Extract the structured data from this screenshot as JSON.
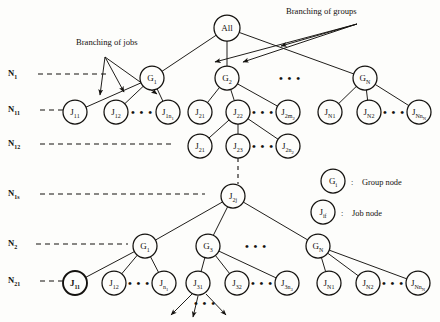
{
  "figure": {
    "background": "#fdfdfb",
    "ink": "#14120f",
    "annotations": [
      {
        "id": "branching-of-groups",
        "text": "Branching of groups",
        "x": 286,
        "y": 14
      },
      {
        "id": "branching-of-jobs",
        "text": "Branching of jobs",
        "x": 76,
        "y": 45
      }
    ],
    "level_labels": [
      {
        "id": "n1",
        "base": "N",
        "sub": "1",
        "x": 8,
        "y": 76,
        "dash_from": 38,
        "dash_to": 108,
        "dash_y": 74
      },
      {
        "id": "n11",
        "base": "N",
        "sub": "11",
        "x": 8,
        "y": 112,
        "dash_from": 40,
        "dash_to": 70,
        "dash_y": 110
      },
      {
        "id": "n12",
        "base": "N",
        "sub": "12",
        "x": 8,
        "y": 146,
        "dash_from": 40,
        "dash_to": 175,
        "dash_y": 144
      },
      {
        "id": "n1s",
        "base": "N",
        "sub": "1s",
        "x": 8,
        "y": 196,
        "dash_from": 40,
        "dash_to": 205,
        "dash_y": 194
      },
      {
        "id": "n2",
        "base": "N",
        "sub": "2",
        "x": 8,
        "y": 246,
        "dash_from": 36,
        "dash_to": 128,
        "dash_y": 244
      },
      {
        "id": "n21",
        "base": "N",
        "sub": "21",
        "x": 8,
        "y": 283,
        "dash_from": 40,
        "dash_to": 68,
        "dash_y": 281
      }
    ],
    "nodes": [
      {
        "id": "root-all",
        "label": "All",
        "sub": "",
        "sub2": "",
        "cx": 227,
        "cy": 28,
        "r": 13,
        "bold": false,
        "type": "root"
      },
      {
        "id": "g1-lvl1",
        "label": "G",
        "sub": "1",
        "sub2": "",
        "cx": 152,
        "cy": 78,
        "r": 12,
        "bold": false,
        "type": "group"
      },
      {
        "id": "g2-lvl1",
        "label": "G",
        "sub": "2",
        "sub2": "",
        "cx": 227,
        "cy": 78,
        "r": 12,
        "bold": false,
        "type": "group"
      },
      {
        "id": "gn-lvl1",
        "label": "G",
        "sub": "N",
        "sub2": "",
        "cx": 365,
        "cy": 78,
        "r": 12,
        "bold": false,
        "type": "group"
      },
      {
        "id": "j11",
        "label": "J",
        "sub": "11",
        "sub2": "",
        "cx": 75,
        "cy": 112,
        "r": 12,
        "bold": false,
        "type": "job"
      },
      {
        "id": "j12",
        "label": "J",
        "sub": "12",
        "sub2": "",
        "cx": 116,
        "cy": 112,
        "r": 12,
        "bold": false,
        "type": "job"
      },
      {
        "id": "j1n1",
        "label": "J",
        "sub": "1n",
        "sub2": "1",
        "cx": 168,
        "cy": 112,
        "r": 12,
        "bold": false,
        "type": "job"
      },
      {
        "id": "j21-a",
        "label": "J",
        "sub": "21",
        "sub2": "",
        "cx": 200,
        "cy": 112,
        "r": 12,
        "bold": false,
        "type": "job"
      },
      {
        "id": "j22",
        "label": "J",
        "sub": "22",
        "sub2": "",
        "cx": 238,
        "cy": 112,
        "r": 12,
        "bold": false,
        "type": "job"
      },
      {
        "id": "j2m2",
        "label": "J",
        "sub": "2m",
        "sub2": "2",
        "cx": 288,
        "cy": 112,
        "r": 12,
        "bold": false,
        "type": "job"
      },
      {
        "id": "jn1",
        "label": "J",
        "sub": "N1",
        "sub2": "",
        "cx": 330,
        "cy": 112,
        "r": 12,
        "bold": false,
        "type": "job"
      },
      {
        "id": "jn2",
        "label": "J",
        "sub": "N2",
        "sub2": "",
        "cx": 369,
        "cy": 112,
        "r": 12,
        "bold": false,
        "type": "job"
      },
      {
        "id": "jnnn",
        "label": "J",
        "sub": "Nn",
        "sub2": "N",
        "cx": 419,
        "cy": 112,
        "r": 12,
        "bold": false,
        "type": "job"
      },
      {
        "id": "j21-b",
        "label": "J",
        "sub": "21",
        "sub2": "",
        "cx": 200,
        "cy": 146,
        "r": 12,
        "bold": false,
        "type": "job"
      },
      {
        "id": "j23",
        "label": "J",
        "sub": "23",
        "sub2": "",
        "cx": 238,
        "cy": 146,
        "r": 12,
        "bold": false,
        "type": "job"
      },
      {
        "id": "j2n2",
        "label": "J",
        "sub": "2n",
        "sub2": "2",
        "cx": 288,
        "cy": 146,
        "r": 12,
        "bold": false,
        "type": "job"
      },
      {
        "id": "j2j",
        "label": "J",
        "sub": "2j",
        "sub2": "",
        "cx": 233,
        "cy": 196,
        "r": 12,
        "bold": false,
        "type": "job"
      },
      {
        "id": "g1-lvl2",
        "label": "G",
        "sub": "1",
        "sub2": "",
        "cx": 145,
        "cy": 246,
        "r": 12,
        "bold": false,
        "type": "group"
      },
      {
        "id": "g3-lvl2",
        "label": "G",
        "sub": "3",
        "sub2": "",
        "cx": 208,
        "cy": 246,
        "r": 12,
        "bold": false,
        "type": "group"
      },
      {
        "id": "gn-lvl2",
        "label": "G",
        "sub": "N",
        "sub2": "",
        "cx": 318,
        "cy": 246,
        "r": 12,
        "bold": false,
        "type": "group"
      },
      {
        "id": "j11-bold",
        "label": "J",
        "sub": "11",
        "sub2": "",
        "cx": 75,
        "cy": 283,
        "r": 12,
        "bold": true,
        "type": "job"
      },
      {
        "id": "j12-lvl2",
        "label": "J",
        "sub": "12",
        "sub2": "",
        "cx": 114,
        "cy": 283,
        "r": 12,
        "bold": false,
        "type": "job"
      },
      {
        "id": "jn1-lvl2",
        "label": "J",
        "sub": "n",
        "sub2": "1",
        "cx": 164,
        "cy": 283,
        "r": 12,
        "bold": false,
        "type": "job"
      },
      {
        "id": "j31",
        "label": "J",
        "sub": "31",
        "sub2": "",
        "cx": 198,
        "cy": 283,
        "r": 12,
        "bold": false,
        "type": "job"
      },
      {
        "id": "j32",
        "label": "J",
        "sub": "32",
        "sub2": "",
        "cx": 237,
        "cy": 283,
        "r": 12,
        "bold": false,
        "type": "job"
      },
      {
        "id": "j3n3",
        "label": "J",
        "sub": "3n",
        "sub2": "3",
        "cx": 287,
        "cy": 283,
        "r": 12,
        "bold": false,
        "type": "job"
      },
      {
        "id": "jn1-bot",
        "label": "J",
        "sub": "N1",
        "sub2": "",
        "cx": 329,
        "cy": 283,
        "r": 12,
        "bold": false,
        "type": "job"
      },
      {
        "id": "jn2-bot",
        "label": "J",
        "sub": "N2",
        "sub2": "",
        "cx": 368,
        "cy": 283,
        "r": 12,
        "bold": false,
        "type": "job"
      },
      {
        "id": "jnnn-bot",
        "label": "J",
        "sub": "Nn",
        "sub2": "N",
        "cx": 418,
        "cy": 283,
        "r": 12,
        "bold": false,
        "type": "job"
      }
    ],
    "edges": [
      {
        "from": "root-all",
        "to": "g1-lvl1"
      },
      {
        "from": "root-all",
        "to": "g2-lvl1"
      },
      {
        "from": "root-all",
        "to": "gn-lvl1"
      },
      {
        "from": "g1-lvl1",
        "to": "j11"
      },
      {
        "from": "g1-lvl1",
        "to": "j12"
      },
      {
        "from": "g1-lvl1",
        "to": "j1n1"
      },
      {
        "from": "g2-lvl1",
        "to": "j21-a"
      },
      {
        "from": "g2-lvl1",
        "to": "j22"
      },
      {
        "from": "g2-lvl1",
        "to": "j2m2"
      },
      {
        "from": "gn-lvl1",
        "to": "jn1"
      },
      {
        "from": "gn-lvl1",
        "to": "jn2"
      },
      {
        "from": "gn-lvl1",
        "to": "jnnn"
      },
      {
        "from": "j22",
        "to": "j21-b"
      },
      {
        "from": "j22",
        "to": "j23"
      },
      {
        "from": "j22",
        "to": "j2n2"
      },
      {
        "from": "j2j",
        "to": "g1-lvl2"
      },
      {
        "from": "j2j",
        "to": "g3-lvl2"
      },
      {
        "from": "j2j",
        "to": "gn-lvl2"
      },
      {
        "from": "g1-lvl2",
        "to": "j11-bold"
      },
      {
        "from": "g1-lvl2",
        "to": "j12-lvl2"
      },
      {
        "from": "g1-lvl2",
        "to": "jn1-lvl2"
      },
      {
        "from": "g3-lvl2",
        "to": "j31"
      },
      {
        "from": "g3-lvl2",
        "to": "j32"
      },
      {
        "from": "g3-lvl2",
        "to": "j3n3"
      },
      {
        "from": "gn-lvl2",
        "to": "jn1-bot"
      },
      {
        "from": "gn-lvl2",
        "to": "jn2-bot"
      },
      {
        "from": "gn-lvl2",
        "to": "jnnn-bot"
      }
    ],
    "dashed_connector": {
      "id": "j23-to-j2j",
      "x": 238,
      "y1": 158,
      "y2": 184
    },
    "ellipses": [
      {
        "id": "ellipsis-top-row",
        "text": "• • •",
        "x": 290,
        "y": 82
      },
      {
        "id": "ellipsis-j1-row",
        "text": "• • •",
        "x": 142,
        "y": 116
      },
      {
        "id": "ellipsis-j2-row",
        "text": "• • •",
        "x": 263,
        "y": 116
      },
      {
        "id": "ellipsis-jn-row",
        "text": "• • •",
        "x": 394,
        "y": 116
      },
      {
        "id": "ellipsis-j2sub-row",
        "text": "• • •",
        "x": 263,
        "y": 150
      },
      {
        "id": "ellipsis-group-lvl2",
        "text": "• • •",
        "x": 256,
        "y": 250
      },
      {
        "id": "ellipsis-jbot-left",
        "text": "• • •",
        "x": 139,
        "y": 287
      },
      {
        "id": "ellipsis-jbot-mid",
        "text": "• • •",
        "x": 262,
        "y": 287
      },
      {
        "id": "ellipsis-jbot-right",
        "text": "• • •",
        "x": 393,
        "y": 287
      },
      {
        "id": "ellipsis-terminal-arrows",
        "text": "• • •",
        "x": 205,
        "y": 307
      }
    ],
    "pointer_arrows": [
      {
        "id": "groups-arrow-1",
        "x1": 357,
        "y1": 24,
        "x2": 215,
        "y2": 62
      },
      {
        "id": "groups-arrow-2",
        "x1": 357,
        "y1": 24,
        "x2": 243,
        "y2": 62
      },
      {
        "id": "groups-arrow-3",
        "x1": 357,
        "y1": 24,
        "x2": 281,
        "y2": 46
      },
      {
        "id": "jobs-arrow-1",
        "x1": 105,
        "y1": 57,
        "x2": 100,
        "y2": 95
      },
      {
        "id": "jobs-arrow-2",
        "x1": 105,
        "y1": 57,
        "x2": 124,
        "y2": 92
      },
      {
        "id": "jobs-arrow-3",
        "x1": 105,
        "y1": 57,
        "x2": 157,
        "y2": 94
      }
    ],
    "terminal_arrows": [
      {
        "id": "terminal-arrow-left",
        "x1": 192,
        "y1": 294,
        "x2": 171,
        "y2": 315
      },
      {
        "id": "terminal-arrow-mid",
        "x1": 198,
        "y1": 296,
        "x2": 193,
        "y2": 317
      },
      {
        "id": "terminal-arrow-right",
        "x1": 206,
        "y1": 294,
        "x2": 226,
        "y2": 315
      }
    ],
    "legend": {
      "items": [
        {
          "id": "legend-group-node",
          "node_label": "G",
          "node_sub": "i",
          "separator": ":",
          "text": "Group node",
          "cx": 333,
          "cy": 181,
          "r": 12,
          "text_x": 362,
          "text_y": 185
        },
        {
          "id": "legend-job-node",
          "node_label": "J",
          "node_sub": "if",
          "separator": ":",
          "text": "Job node",
          "cx": 323,
          "cy": 212,
          "r": 12,
          "text_x": 352,
          "text_y": 216
        }
      ]
    }
  }
}
